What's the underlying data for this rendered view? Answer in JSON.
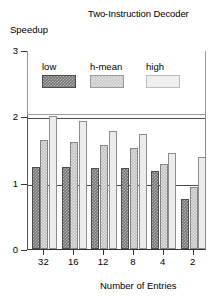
{
  "chart_data": {
    "type": "bar",
    "title": "Two-Instruction Decoder",
    "xlabel": "Number of Entries",
    "ylabel": "Speedup",
    "categories": [
      "32",
      "16",
      "12",
      "8",
      "4",
      "2"
    ],
    "series": [
      {
        "name": "low",
        "values": [
          1.23,
          1.23,
          1.22,
          1.22,
          1.18,
          0.75
        ]
      },
      {
        "name": "h-mean",
        "values": [
          1.65,
          1.62,
          1.57,
          1.52,
          1.28,
          0.93
        ]
      },
      {
        "name": "high",
        "values": [
          2.0,
          1.93,
          1.78,
          1.73,
          1.45,
          1.38
        ]
      }
    ],
    "ylim": [
      0,
      3
    ],
    "yticks": [
      "0",
      "1",
      "2",
      "3"
    ],
    "grid": true,
    "legend_position": "top-inside",
    "colors": {
      "low": "#757575",
      "h-mean": "#c2c2c2",
      "high": "#ececec",
      "axis": "#333333",
      "grid": "#4a4a4a"
    }
  }
}
